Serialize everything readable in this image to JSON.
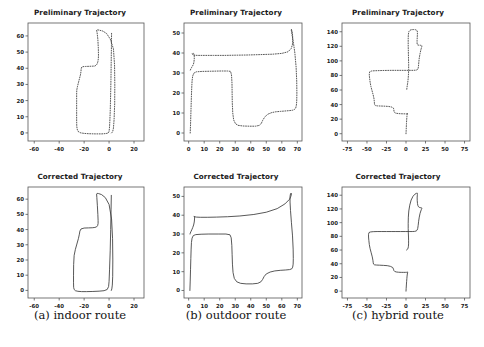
{
  "figure": {
    "title_preliminary": "Preliminary Trajectory",
    "title_corrected": "Corrected Trajectory",
    "captions": {
      "a": "(a) indoor route",
      "b": "(b) outdoor route",
      "c": "(c) hybrid route"
    },
    "colors": {
      "line": "#3a3a3a",
      "axis": "#555555",
      "text": "#1a1a1a",
      "background": "#ffffff"
    }
  },
  "chart_data": [
    {
      "id": "a-preliminary",
      "type": "line",
      "title": "Preliminary Trajectory",
      "panel": "(a) indoor route",
      "linestyle": "dotted",
      "xlabel": "",
      "ylabel": "",
      "xlim": [
        -65,
        28
      ],
      "ylim": [
        -5,
        68
      ],
      "xticks": [
        -60,
        -40,
        -20,
        0,
        20
      ],
      "yticks": [
        0,
        10,
        20,
        30,
        40,
        50,
        60
      ],
      "grid": false,
      "legend": "none",
      "x": [
        2.0,
        2.5,
        3.0,
        3.5,
        4.0,
        4.5,
        4.6,
        4.4,
        3.5,
        1.0,
        -2.0,
        -5.0,
        -8.0,
        -9.5,
        -10.0,
        -9.6,
        -9.0,
        -8.6,
        -8.5,
        -8.6,
        -9.0,
        -9.6,
        -10.5,
        -11.5,
        -13.0,
        -16.0,
        -19.0,
        -21.0,
        -22.0,
        -22.4,
        -22.5,
        -22.8,
        -23.6,
        -24.6,
        -25.4,
        -25.9,
        -26.0,
        -26.0,
        -26.0,
        -26.0,
        -25.9,
        -25.4,
        -24.4,
        -22.6,
        -20.0,
        -16.0,
        -11.0,
        -6.0,
        -2.5,
        -0.6,
        0.0,
        0.3,
        0.6,
        0.9,
        1.2,
        1.5,
        1.7,
        1.9,
        2.0
      ],
      "y": [
        0.0,
        0.4,
        1.2,
        3.0,
        8.0,
        18.0,
        30.0,
        42.0,
        52.0,
        58.0,
        61.5,
        63.0,
        63.6,
        63.8,
        63.5,
        62.0,
        58.0,
        52.0,
        48.0,
        46.0,
        44.0,
        42.6,
        41.8,
        41.4,
        41.3,
        41.2,
        41.1,
        41.0,
        40.6,
        39.6,
        38.3,
        36.5,
        34.0,
        31.0,
        28.5,
        26.5,
        24.0,
        20.0,
        14.0,
        8.0,
        4.0,
        1.8,
        0.6,
        0.0,
        -0.3,
        -0.5,
        -0.6,
        -0.6,
        -0.4,
        0.0,
        1.0,
        3.0,
        7.0,
        13.0,
        22.0,
        33.0,
        44.0,
        54.0,
        62.0
      ]
    },
    {
      "id": "a-corrected",
      "type": "line",
      "title": "Corrected Trajectory",
      "panel": "(a) indoor route",
      "linestyle": "solid",
      "xlabel": "",
      "ylabel": "",
      "xlim": [
        -65,
        28
      ],
      "ylim": [
        -5,
        68
      ],
      "xticks": [
        -60,
        -40,
        -20,
        0,
        20
      ],
      "yticks": [
        0,
        10,
        20,
        30,
        40,
        50,
        60
      ],
      "grid": false,
      "legend": "none",
      "x": [
        1.8,
        2.2,
        2.6,
        2.9,
        3.0,
        2.8,
        2.0,
        0.0,
        -3.0,
        -6.0,
        -8.5,
        -9.6,
        -10.0,
        -9.8,
        -9.4,
        -9.0,
        -8.8,
        -8.8,
        -9.2,
        -10.0,
        -11.4,
        -13.5,
        -16.5,
        -20.0,
        -22.5,
        -23.4,
        -23.8,
        -24.6,
        -25.8,
        -27.0,
        -28.0,
        -28.4,
        -28.5,
        -28.5,
        -28.4,
        -28.0,
        -27.0,
        -25.0,
        -22.0,
        -18.0,
        -13.0,
        -8.0,
        -4.0,
        -1.5,
        -0.4,
        0.0,
        0.4,
        0.9,
        1.3,
        1.6,
        1.8
      ],
      "y": [
        0.0,
        1.0,
        3.5,
        9.0,
        20.0,
        34.0,
        47.0,
        56.5,
        61.0,
        63.0,
        63.7,
        63.8,
        63.4,
        61.0,
        56.0,
        50.0,
        46.0,
        44.0,
        42.6,
        41.8,
        41.4,
        41.2,
        41.1,
        41.0,
        40.4,
        39.0,
        37.0,
        34.0,
        30.5,
        27.0,
        23.0,
        17.0,
        10.0,
        5.0,
        2.0,
        0.6,
        -0.2,
        -0.6,
        -0.8,
        -0.8,
        -0.7,
        -0.5,
        -0.2,
        0.6,
        2.5,
        6.0,
        14.0,
        26.0,
        40.0,
        53.0,
        62.5
      ]
    },
    {
      "id": "b-preliminary",
      "type": "line",
      "title": "Preliminary Trajectory",
      "panel": "(b) outdoor route",
      "linestyle": "dotted",
      "xlabel": "",
      "ylabel": "",
      "xlim": [
        -3,
        73
      ],
      "ylim": [
        -4,
        55
      ],
      "xticks": [
        0,
        10,
        20,
        30,
        40,
        50,
        60,
        70
      ],
      "yticks": [
        0,
        10,
        20,
        30,
        40,
        50
      ],
      "grid": false,
      "legend": "none",
      "x": [
        1.0,
        1.2,
        1.4,
        1.6,
        1.8,
        2.0,
        2.2,
        2.6,
        3.4,
        5.0,
        9.0,
        15.0,
        21.0,
        25.0,
        27.0,
        27.6,
        27.9,
        28.0,
        28.1,
        28.4,
        29.0,
        30.2,
        32.0,
        35.0,
        39.0,
        43.0,
        45.5,
        46.8,
        47.6,
        49.0,
        51.0,
        53.5,
        56.0,
        59.0,
        62.0,
        65.0,
        67.0,
        68.2,
        69.0,
        69.4,
        69.6,
        69.7,
        69.6,
        69.2,
        68.4,
        67.4,
        66.6,
        66.2,
        66.0,
        66.1,
        66.4,
        66.8,
        67.0,
        67.0,
        66.8,
        66.0,
        64.0,
        60.0,
        54.0,
        46.0,
        38.0,
        30.0,
        23.0,
        16.0,
        10.0,
        6.0,
        3.6,
        2.6,
        2.3,
        2.4,
        2.6,
        3.0,
        3.4,
        3.6,
        3.6,
        3.4,
        3.0,
        2.4,
        1.8,
        1.4,
        1.1,
        1.0
      ],
      "y": [
        0.0,
        4.0,
        9.0,
        14.0,
        19.0,
        23.0,
        26.0,
        28.5,
        30.0,
        30.6,
        30.8,
        30.9,
        31.0,
        31.0,
        30.8,
        29.0,
        25.0,
        20.0,
        15.0,
        10.0,
        6.5,
        4.6,
        3.8,
        3.5,
        3.4,
        3.4,
        3.8,
        4.8,
        6.2,
        8.0,
        9.4,
        10.2,
        10.6,
        10.8,
        11.0,
        11.2,
        11.4,
        11.8,
        12.6,
        14.0,
        16.0,
        20.0,
        26.0,
        33.0,
        40.0,
        45.5,
        49.0,
        51.0,
        51.8,
        51.9,
        51.4,
        50.0,
        48.0,
        46.0,
        44.0,
        42.2,
        40.6,
        39.8,
        39.4,
        39.2,
        39.0,
        38.9,
        38.8,
        38.8,
        38.8,
        38.8,
        38.9,
        39.2,
        39.6,
        39.8,
        39.9,
        39.9,
        39.6,
        38.6,
        37.0,
        35.4,
        34.2,
        33.4,
        32.6,
        32.0,
        31.5,
        31.2
      ]
    },
    {
      "id": "b-corrected",
      "type": "line",
      "title": "Corrected Trajectory",
      "panel": "(b) outdoor route",
      "linestyle": "solid",
      "xlabel": "",
      "ylabel": "",
      "xlim": [
        -3,
        73
      ],
      "ylim": [
        -4,
        55
      ],
      "xticks": [
        0,
        10,
        20,
        30,
        40,
        50,
        60,
        70
      ],
      "yticks": [
        0,
        10,
        20,
        30,
        40,
        50
      ],
      "grid": false,
      "legend": "none",
      "x": [
        0.8,
        1.0,
        1.2,
        1.4,
        1.6,
        1.8,
        2.2,
        3.0,
        4.6,
        8.0,
        13.0,
        19.0,
        24.0,
        26.6,
        27.4,
        27.8,
        28.0,
        28.2,
        28.6,
        29.4,
        31.0,
        33.5,
        37.0,
        41.0,
        44.5,
        46.5,
        47.6,
        48.6,
        50.0,
        52.5,
        55.5,
        59.0,
        62.5,
        65.0,
        66.4,
        67.0,
        67.3,
        67.4,
        67.3,
        66.9,
        66.2,
        65.6,
        65.3,
        65.3,
        65.6,
        66.0,
        66.2,
        66.0,
        65.0,
        62.0,
        57.0,
        50.0,
        42.0,
        33.0,
        25.0,
        18.0,
        12.0,
        7.5,
        5.0,
        3.8,
        3.4,
        3.4,
        3.6,
        3.8,
        3.8,
        3.6,
        3.2,
        2.6,
        2.0,
        1.4,
        1.0,
        0.9
      ],
      "y": [
        0.0,
        5.0,
        11.0,
        17.0,
        22.0,
        25.5,
        27.8,
        29.2,
        29.7,
        29.9,
        30.0,
        30.0,
        30.0,
        29.6,
        28.0,
        24.0,
        19.0,
        14.0,
        9.5,
        6.4,
        4.6,
        3.8,
        3.5,
        3.5,
        3.8,
        4.6,
        5.8,
        7.4,
        8.8,
        9.8,
        10.4,
        10.7,
        10.9,
        11.1,
        11.5,
        12.4,
        14.0,
        17.0,
        22.0,
        29.0,
        36.0,
        42.5,
        47.0,
        50.0,
        51.4,
        51.8,
        51.5,
        50.4,
        48.5,
        46.0,
        43.5,
        41.6,
        40.4,
        39.6,
        39.2,
        39.0,
        38.9,
        38.9,
        39.0,
        39.2,
        39.4,
        39.5,
        39.4,
        39.0,
        38.0,
        36.4,
        34.8,
        33.4,
        32.2,
        31.2,
        30.4,
        30.0
      ]
    },
    {
      "id": "c-preliminary",
      "type": "line",
      "title": "Preliminary Trajectory",
      "panel": "(c) hybrid route",
      "linestyle": "dotted",
      "xlabel": "",
      "ylabel": "",
      "xlim": [
        -82,
        82
      ],
      "ylim": [
        -10,
        152
      ],
      "xticks": [
        -75,
        -50,
        -25,
        0,
        25,
        50,
        75
      ],
      "yticks": [
        0,
        20,
        40,
        60,
        80,
        100,
        120,
        140
      ],
      "grid": false,
      "legend": "none",
      "x": [
        0.0,
        0.2,
        0.4,
        0.6,
        0.8,
        1.0,
        1.2,
        1.4,
        1.6,
        1.8,
        2.0,
        2.2,
        2.4,
        2.2,
        1.6,
        0.6,
        -1.0,
        -3.0,
        -6.0,
        -9.0,
        -12.0,
        -14.0,
        -15.0,
        -15.4,
        -15.6,
        -16.0,
        -18.0,
        -22.0,
        -27.0,
        -32.0,
        -36.5,
        -39.0,
        -40.0,
        -40.4,
        -40.6,
        -41.0,
        -42.0,
        -43.5,
        -45.0,
        -46.0,
        -46.6,
        -47.0,
        -47.0,
        -46.4,
        -44.5,
        -41.0,
        -36.0,
        -30.0,
        -24.0,
        -18.0,
        -12.0,
        -6.0,
        0.0,
        5.0,
        9.0,
        12.0,
        14.0,
        15.0,
        15.6,
        16.0,
        16.4,
        17.0,
        18.0,
        19.0,
        19.8,
        20.2,
        20.4,
        20.4,
        20.2,
        19.6,
        18.6,
        17.4,
        16.2,
        15.2,
        14.6,
        14.3,
        14.2,
        14.2,
        14.4,
        14.6,
        14.6,
        14.4,
        13.6,
        12.0,
        9.6,
        7.0,
        5.0,
        3.6,
        3.0,
        2.8,
        2.8,
        3.0,
        3.2,
        3.4,
        3.4,
        3.2,
        2.8,
        2.2,
        1.6,
        1.2,
        1.0,
        1.0
      ],
      "y": [
        0.0,
        4.0,
        9.0,
        14.0,
        18.0,
        21.0,
        24.0,
        26.0,
        27.0,
        27.6,
        28.0,
        28.0,
        27.8,
        27.6,
        27.4,
        27.3,
        27.3,
        27.3,
        27.4,
        27.6,
        28.0,
        28.6,
        29.6,
        31.0,
        33.0,
        35.0,
        36.5,
        37.4,
        37.8,
        38.0,
        38.2,
        38.6,
        39.4,
        41.0,
        44.0,
        48.0,
        53.0,
        59.0,
        65.0,
        71.0,
        76.0,
        80.0,
        83.0,
        85.0,
        86.0,
        86.4,
        86.6,
        86.8,
        86.9,
        87.0,
        87.0,
        87.0,
        87.0,
        87.0,
        87.0,
        87.2,
        87.6,
        88.4,
        90.0,
        93.0,
        98.0,
        104.0,
        110.0,
        115.0,
        118.0,
        119.6,
        120.4,
        120.8,
        121.0,
        121.2,
        121.4,
        121.5,
        121.6,
        121.8,
        122.2,
        123.0,
        125.0,
        128.0,
        132.0,
        136.0,
        139.0,
        141.0,
        142.2,
        142.8,
        143.0,
        142.8,
        142.0,
        140.0,
        136.0,
        130.0,
        122.0,
        113.0,
        104.0,
        95.0,
        88.0,
        82.0,
        76.0,
        70.0,
        66.0,
        63.0,
        61.0,
        60.0
      ]
    },
    {
      "id": "c-corrected",
      "type": "line",
      "title": "Corrected Trajectory",
      "panel": "(c) hybrid route",
      "linestyle": "solid",
      "xlabel": "",
      "ylabel": "",
      "xlim": [
        -82,
        82
      ],
      "ylim": [
        -10,
        152
      ],
      "xticks": [
        -75,
        -50,
        -25,
        0,
        25,
        50,
        75
      ],
      "yticks": [
        0,
        20,
        40,
        60,
        80,
        100,
        120,
        140
      ],
      "grid": false,
      "legend": "none",
      "x": [
        0.0,
        0.2,
        0.5,
        0.8,
        1.1,
        1.4,
        1.7,
        2.0,
        2.2,
        2.2,
        1.8,
        0.8,
        -0.8,
        -3.0,
        -6.0,
        -9.5,
        -12.5,
        -14.5,
        -15.5,
        -16.0,
        -17.0,
        -20.0,
        -24.0,
        -29.0,
        -34.0,
        -38.0,
        -40.5,
        -41.6,
        -42.0,
        -42.4,
        -43.2,
        -44.6,
        -46.0,
        -47.0,
        -47.6,
        -48.0,
        -48.0,
        -47.4,
        -45.5,
        -42.0,
        -37.0,
        -31.0,
        -25.0,
        -19.0,
        -13.0,
        -7.0,
        -1.0,
        4.0,
        8.0,
        11.0,
        13.0,
        14.2,
        15.0,
        15.6,
        16.2,
        17.0,
        18.0,
        19.0,
        19.8,
        20.2,
        20.4,
        20.3,
        19.9,
        19.2,
        18.2,
        17.0,
        16.0,
        15.2,
        14.7,
        14.4,
        14.3,
        14.4,
        14.6,
        14.7,
        14.6,
        14.2,
        13.2,
        11.4,
        9.0,
        6.6,
        4.8,
        3.6,
        3.0,
        2.8,
        2.8,
        3.0,
        3.2,
        3.3,
        3.3,
        3.1,
        2.7,
        2.1,
        1.5,
        1.1,
        0.9,
        0.9
      ],
      "y": [
        0.0,
        4.0,
        9.0,
        14.0,
        18.5,
        22.0,
        25.0,
        26.8,
        27.8,
        28.0,
        27.8,
        27.5,
        27.4,
        27.4,
        27.4,
        27.6,
        28.0,
        28.8,
        30.0,
        32.0,
        34.5,
        36.2,
        37.2,
        37.6,
        37.9,
        38.1,
        38.5,
        39.5,
        41.5,
        45.0,
        50.0,
        56.0,
        62.0,
        68.0,
        74.0,
        79.0,
        83.0,
        85.5,
        86.4,
        86.8,
        87.0,
        87.0,
        87.0,
        87.0,
        87.0,
        87.0,
        87.0,
        87.0,
        87.0,
        87.2,
        87.8,
        89.0,
        91.5,
        96.0,
        102.0,
        108.0,
        113.5,
        117.0,
        119.4,
        120.6,
        121.1,
        121.4,
        121.6,
        121.7,
        121.9,
        122.3,
        123.2,
        125.0,
        128.0,
        132.0,
        136.0,
        139.0,
        141.0,
        142.3,
        142.9,
        143.0,
        142.7,
        141.5,
        138.5,
        133.0,
        125.5,
        117.0,
        108.0,
        99.0,
        91.5,
        85.0,
        79.0,
        73.5,
        69.0,
        65.5,
        63.0,
        61.5,
        60.6,
        60.2,
        60.0,
        60.0
      ]
    }
  ]
}
